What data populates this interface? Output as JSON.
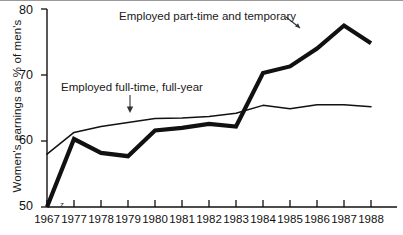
{
  "chart_data": {
    "type": "line",
    "title": "",
    "xlabel": "",
    "ylabel": "Women's earnings as % of men's",
    "x": [
      1967,
      1977,
      1978,
      1979,
      1980,
      1981,
      1982,
      1983,
      1984,
      1985,
      1986,
      1987,
      1988
    ],
    "xtick_labels": [
      "1967",
      "1977",
      "1978",
      "1979",
      "1980",
      "1981",
      "1982",
      "1983",
      "1984",
      "1985",
      "1986",
      "1987",
      "1988"
    ],
    "ytick_labels": [
      "50",
      "60",
      "70",
      "80"
    ],
    "yticks": [
      50,
      60,
      70,
      80
    ],
    "ylim": [
      50,
      80
    ],
    "grid": false,
    "legend_position": "inline-annotations",
    "series": [
      {
        "name": "Employed part-time and temporary",
        "style": "thick",
        "values": [
          50.0,
          60.3,
          58.2,
          57.7,
          61.6,
          62.0,
          62.6,
          62.2,
          70.3,
          71.3,
          74.0,
          77.5,
          74.8
        ]
      },
      {
        "name": "Employed full-time, full-year",
        "style": "thin",
        "values": [
          58.0,
          61.3,
          62.2,
          62.8,
          63.4,
          63.5,
          63.7,
          64.2,
          65.4,
          64.9,
          65.5,
          65.5,
          65.2
        ]
      }
    ],
    "annotations": [
      {
        "name": "part-time-label",
        "text": "Employed part-time and temporary",
        "arrow": "down-right"
      },
      {
        "name": "full-time-label",
        "text": "Employed full-time, full-year",
        "arrow": "down"
      }
    ],
    "artifacts": [
      {
        "name": "z-mark",
        "text": "z"
      }
    ]
  }
}
